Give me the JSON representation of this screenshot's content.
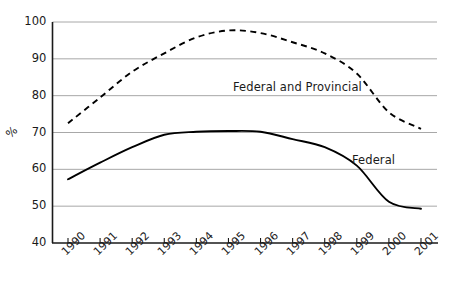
{
  "chart_data": {
    "type": "line",
    "title": "",
    "subtitle": "",
    "xlabel": "",
    "ylabel": "%",
    "x": [
      "1990",
      "1991",
      "1992",
      "1993",
      "1994",
      "1995",
      "1996",
      "1997",
      "1998",
      "1999",
      "2000",
      "2001"
    ],
    "xlim": [
      "1990",
      "2001"
    ],
    "ylim": [
      40,
      100
    ],
    "yticks": [
      40,
      50,
      60,
      70,
      80,
      90,
      100
    ],
    "ytick_labels": [
      "40",
      "50",
      "60",
      "70",
      "80",
      "90",
      "100"
    ],
    "grid": "horizontal",
    "legend": "inline-annotations",
    "series": [
      {
        "name": "Federal and Provincial",
        "style": "dashed",
        "color": "#000000",
        "values": [
          72.5,
          79.5,
          86.5,
          91.5,
          95.8,
          97.7,
          97.0,
          94.5,
          91.5,
          86.0,
          75.5,
          71.0
        ]
      },
      {
        "name": "Federal",
        "style": "solid",
        "color": "#000000",
        "values": [
          57.3,
          61.8,
          66.0,
          69.4,
          70.2,
          70.4,
          70.2,
          68.2,
          66.0,
          61.0,
          51.2,
          49.3
        ]
      }
    ],
    "annotations": [
      {
        "text": "Federal and Provincial",
        "x_px": 233,
        "y_px": 80
      },
      {
        "text": "Federal",
        "x_px": 352,
        "y_px": 153
      }
    ],
    "colors": {
      "axis": "#1a1a1a",
      "gridline": "#a8a8a8",
      "line": "#000000",
      "background": "#ffffff",
      "text": "#1a1a1a"
    }
  },
  "axis": {
    "y_title": "%",
    "y_ticks": [
      "100",
      "90",
      "80",
      "70",
      "60",
      "50",
      "40"
    ],
    "x_ticks": [
      "1990",
      "1991",
      "1992",
      "1993",
      "1994",
      "1995",
      "1996",
      "1997",
      "1998",
      "1999",
      "2000",
      "2001"
    ]
  },
  "labels": {
    "series_federal_provincial": "Federal and Provincial",
    "series_federal": "Federal"
  }
}
